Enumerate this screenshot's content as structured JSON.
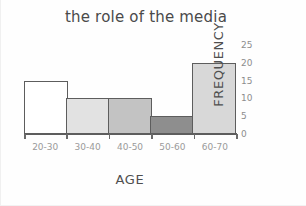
{
  "chart_data": {
    "type": "bar",
    "title": "the role of the media",
    "xlabel": "AGE",
    "ylabel": "FREQUENCY",
    "categories": [
      "20-30",
      "30-40",
      "40-50",
      "50-60",
      "60-70"
    ],
    "values": [
      15,
      10,
      10,
      5,
      20
    ],
    "bar_colors": [
      "#ffffff",
      "#e2e2e2",
      "#c3c3c3",
      "#8e8e8e",
      "#d8d8d8"
    ],
    "bar_border_color": "#5d5d5d",
    "ylim": [
      0,
      25
    ],
    "yticks": [
      0,
      5,
      10,
      15,
      20,
      25
    ],
    "ytick_labels": [
      "0",
      "5",
      "10",
      "15",
      "20",
      "25"
    ],
    "grid": false,
    "legend": null,
    "y_axis_position": "right",
    "axis_color": "#5d5d5d",
    "tick_label_color": "#8d8d8d",
    "title_color": "#4a4a4a"
  }
}
